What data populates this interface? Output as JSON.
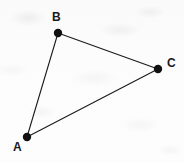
{
  "figure": {
    "canvas": {
      "width": 184,
      "height": 163
    },
    "background_color": "#fbfbfb",
    "stroke_color": "#1a1a1a",
    "vertex_fill_color": "#111111",
    "vertex_radius": 4,
    "edge_width": 1.1,
    "vertices": [
      {
        "id": "A",
        "label": "A",
        "x": 27,
        "y": 137,
        "label_x": 13,
        "label_y": 141
      },
      {
        "id": "B",
        "label": "B",
        "x": 58,
        "y": 33,
        "label_x": 52,
        "label_y": 11
      },
      {
        "id": "C",
        "label": "C",
        "x": 158,
        "y": 69,
        "label_x": 167,
        "label_y": 57
      }
    ],
    "edges": [
      {
        "id": "AB",
        "from": "A",
        "to": "B",
        "x1": 27,
        "y1": 137,
        "x2": 58,
        "y2": 33
      },
      {
        "id": "BC",
        "from": "B",
        "to": "C",
        "x1": 58,
        "y1": 33,
        "x2": 158,
        "y2": 69
      },
      {
        "id": "CA",
        "from": "C",
        "to": "A",
        "x1": 158,
        "y1": 69,
        "x2": 27,
        "y2": 137
      }
    ]
  }
}
